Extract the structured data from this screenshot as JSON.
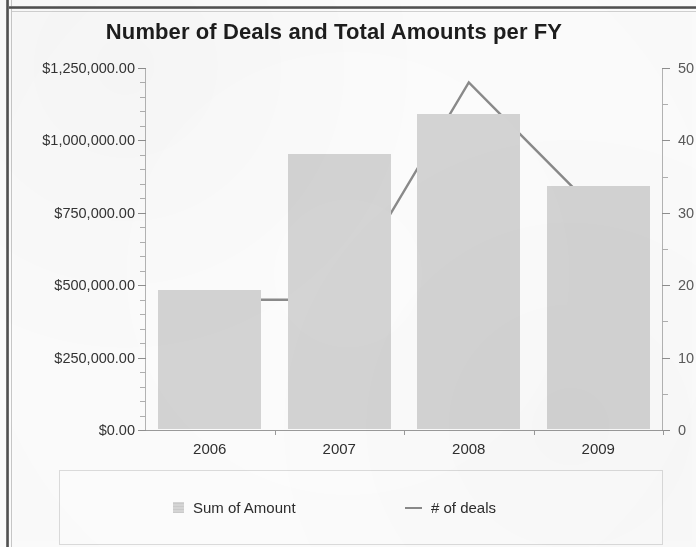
{
  "chart_data": {
    "type": "bar",
    "title": "Number of Deals and Total Amounts per FY",
    "xlabel": "",
    "ylabel": "",
    "categories": [
      "2006",
      "2007",
      "2008",
      "2009"
    ],
    "grid": false,
    "legend_position": "bottom",
    "series": [
      {
        "name": "Sum of Amount",
        "type": "bar",
        "axis": "left",
        "color": "#d4d4d4",
        "values": [
          480000,
          950000,
          1088000,
          839000
        ]
      },
      {
        "name": "# of deals",
        "type": "line",
        "axis": "right",
        "color": "#8a8a8a",
        "values": [
          18,
          18,
          48,
          30
        ]
      }
    ],
    "y_left": {
      "min": 0,
      "max": 1250000,
      "tick_step": 250000,
      "minor_tick_step": 50000,
      "tick_labels": [
        "$0.00",
        "$250,000.00",
        "$500,000.00",
        "$750,000.00",
        "$1,000,000.00",
        "$1,250,000.00"
      ],
      "tick_values": [
        0,
        250000,
        500000,
        750000,
        1000000,
        1250000
      ]
    },
    "y_right": {
      "min": 0,
      "max": 50,
      "tick_step": 10,
      "minor_tick_step": 5,
      "tick_labels": [
        "0",
        "10",
        "20",
        "30",
        "40",
        "50"
      ],
      "tick_values": [
        0,
        10,
        20,
        30,
        40,
        50
      ]
    }
  },
  "legend": {
    "items": [
      {
        "label": "Sum of Amount",
        "marker": "bar-swatch-icon"
      },
      {
        "label": "# of deals",
        "marker": "line-swatch-icon"
      }
    ]
  }
}
